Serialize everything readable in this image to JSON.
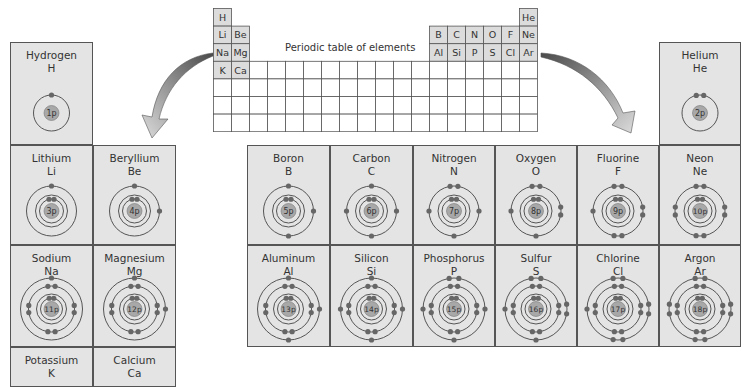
{
  "mini_table": {
    "title": "Periodic table of elements",
    "columns": 18,
    "rows": 7,
    "shaded_cells": [
      {
        "row": 0,
        "col": 0,
        "symbol": "H"
      },
      {
        "row": 0,
        "col": 17,
        "symbol": "He"
      },
      {
        "row": 1,
        "col": 0,
        "symbol": "Li"
      },
      {
        "row": 1,
        "col": 1,
        "symbol": "Be"
      },
      {
        "row": 1,
        "col": 12,
        "symbol": "B"
      },
      {
        "row": 1,
        "col": 13,
        "symbol": "C"
      },
      {
        "row": 1,
        "col": 14,
        "symbol": "N"
      },
      {
        "row": 1,
        "col": 15,
        "symbol": "O"
      },
      {
        "row": 1,
        "col": 16,
        "symbol": "F"
      },
      {
        "row": 1,
        "col": 17,
        "symbol": "Ne"
      },
      {
        "row": 2,
        "col": 0,
        "symbol": "Na"
      },
      {
        "row": 2,
        "col": 1,
        "symbol": "Mg"
      },
      {
        "row": 2,
        "col": 12,
        "symbol": "Al"
      },
      {
        "row": 2,
        "col": 13,
        "symbol": "Si"
      },
      {
        "row": 2,
        "col": 14,
        "symbol": "P"
      },
      {
        "row": 2,
        "col": 15,
        "symbol": "S"
      },
      {
        "row": 2,
        "col": 16,
        "symbol": "Cl"
      },
      {
        "row": 2,
        "col": 17,
        "symbol": "Ar"
      },
      {
        "row": 3,
        "col": 0,
        "symbol": "K"
      },
      {
        "row": 3,
        "col": 1,
        "symbol": "Ca"
      }
    ]
  },
  "elements": [
    {
      "id": "hydrogen",
      "name": "Hydrogen",
      "symbol": "H",
      "protons": "1p",
      "shells": [
        1
      ]
    },
    {
      "id": "helium",
      "name": "Helium",
      "symbol": "He",
      "protons": "2p",
      "shells": [
        2
      ]
    },
    {
      "id": "lithium",
      "name": "Lithium",
      "symbol": "Li",
      "protons": "3p",
      "shells": [
        2,
        1
      ]
    },
    {
      "id": "beryllium",
      "name": "Beryllium",
      "symbol": "Be",
      "protons": "4p",
      "shells": [
        2,
        2
      ]
    },
    {
      "id": "boron",
      "name": "Boron",
      "symbol": "B",
      "protons": "5p",
      "shells": [
        2,
        3
      ]
    },
    {
      "id": "carbon",
      "name": "Carbon",
      "symbol": "C",
      "protons": "6p",
      "shells": [
        2,
        4
      ]
    },
    {
      "id": "nitrogen",
      "name": "Nitrogen",
      "symbol": "N",
      "protons": "7p",
      "shells": [
        2,
        5
      ]
    },
    {
      "id": "oxygen",
      "name": "Oxygen",
      "symbol": "O",
      "protons": "8p",
      "shells": [
        2,
        6
      ]
    },
    {
      "id": "fluorine",
      "name": "Fluorine",
      "symbol": "F",
      "protons": "9p",
      "shells": [
        2,
        7
      ]
    },
    {
      "id": "neon",
      "name": "Neon",
      "symbol": "Ne",
      "protons": "10p",
      "shells": [
        2,
        8
      ]
    },
    {
      "id": "sodium",
      "name": "Sodium",
      "symbol": "Na",
      "protons": "11p",
      "shells": [
        2,
        8,
        1
      ]
    },
    {
      "id": "magnesium",
      "name": "Magnesium",
      "symbol": "Mg",
      "protons": "12p",
      "shells": [
        2,
        8,
        2
      ]
    },
    {
      "id": "aluminum",
      "name": "Aluminum",
      "symbol": "Al",
      "protons": "13p",
      "shells": [
        2,
        8,
        3
      ]
    },
    {
      "id": "silicon",
      "name": "Silicon",
      "symbol": "Si",
      "protons": "14p",
      "shells": [
        2,
        8,
        4
      ]
    },
    {
      "id": "phosphorus",
      "name": "Phosphorus",
      "symbol": "P",
      "protons": "15p",
      "shells": [
        2,
        8,
        5
      ]
    },
    {
      "id": "sulfur",
      "name": "Sulfur",
      "symbol": "S",
      "protons": "16p",
      "shells": [
        2,
        8,
        6
      ]
    },
    {
      "id": "chlorine",
      "name": "Chlorine",
      "symbol": "Cl",
      "protons": "17p",
      "shells": [
        2,
        8,
        7
      ]
    },
    {
      "id": "argon",
      "name": "Argon",
      "symbol": "Ar",
      "protons": "18p",
      "shells": [
        2,
        8,
        8
      ]
    },
    {
      "id": "potassium",
      "name": "Potassium",
      "symbol": "K",
      "protons": "",
      "shells": []
    },
    {
      "id": "calcium",
      "name": "Calcium",
      "symbol": "Ca",
      "protons": "",
      "shells": []
    }
  ],
  "colors": {
    "cell_fill": "#e4e4e4",
    "border": "#555555",
    "orbit": "#555555",
    "electron": "#666666",
    "nucleus": "#a8a8a8",
    "arrow_dark": "#555555",
    "arrow_light": "#d8d8d8"
  }
}
